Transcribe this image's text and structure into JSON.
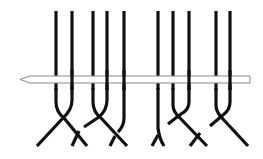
{
  "diagram": {
    "subject": "Knitting stitches on a needle with cable crossings below",
    "colors": {
      "background": "#ffffff",
      "strand": "#111111",
      "needle_fill": "#ffffff",
      "needle_outline": "#8a8a8a"
    },
    "needle": {
      "label": "knitting needle",
      "x1": 20,
      "x2": 250,
      "y_top": 76,
      "y_bottom": 83
    },
    "strand_tops_x": [
      56,
      72,
      93,
      107,
      124,
      158,
      173,
      189,
      216,
      230
    ],
    "groups": [
      {
        "name": "left-group",
        "strands": [
          56,
          72,
          93,
          107,
          124
        ]
      },
      {
        "name": "right-group",
        "strands": [
          158,
          173,
          189,
          216,
          230
        ]
      }
    ]
  }
}
